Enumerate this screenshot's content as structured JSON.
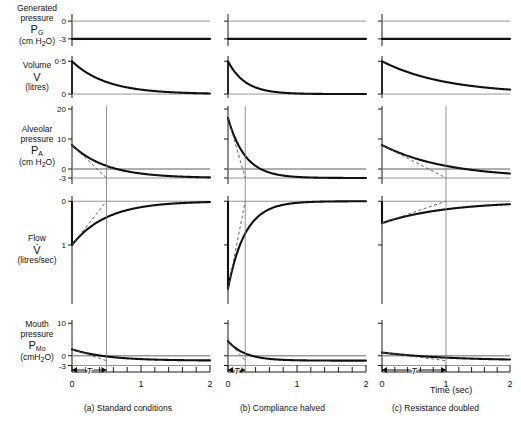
{
  "figure": {
    "xaxis_title": "Time (sec)",
    "x_ticklabels": [
      "0",
      "1",
      "2"
    ],
    "x_tickvalues": [
      0,
      1,
      2
    ],
    "x_minor_step": 0.2,
    "xlim": [
      0,
      2
    ],
    "tau_label": "T"
  },
  "rows": [
    {
      "id": "generated-pressure",
      "label_line1": "Generated",
      "label_line2": "pressure",
      "symbol": "P",
      "symbol_sub": "G",
      "units": "(cm H",
      "units_sub": "2",
      "units_tail": "O)",
      "yticklabels": [
        "0",
        "-3"
      ],
      "ytickvalues": [
        0,
        -3
      ],
      "ylim": [
        -4.2,
        1.2
      ]
    },
    {
      "id": "volume",
      "label_line1": "Volume",
      "label_line2": "",
      "symbol": "V",
      "symbol_sub": "",
      "units": "(litres)",
      "units_sub": "",
      "units_tail": "",
      "yticklabels": [
        "0·5",
        "0"
      ],
      "ytickvalues": [
        0.5,
        0
      ],
      "ylim": [
        -0.06,
        0.58
      ]
    },
    {
      "id": "alveolar-pressure",
      "label_line1": "Alveolar",
      "label_line2": "pressure",
      "symbol": "P",
      "symbol_sub": "A",
      "units": "(cm H",
      "units_sub": "2",
      "units_tail": "O)",
      "yticklabels": [
        "20",
        "10",
        "0",
        "-3"
      ],
      "ytickvalues": [
        20,
        10,
        0,
        -3
      ],
      "ylim": [
        -5.0,
        21.0
      ]
    },
    {
      "id": "flow",
      "label_line1": "Flow",
      "label_line2": "",
      "symbol": "V̇",
      "symbol_sub": "",
      "units": "(litres/sec)",
      "units_sub": "",
      "units_tail": "",
      "yticklabels": [
        "0",
        "1"
      ],
      "ytickvalues": [
        0,
        -1
      ],
      "ylim": [
        -2.35,
        0.12
      ]
    },
    {
      "id": "mouth-pressure",
      "label_line1": "Mouth",
      "label_line2": "pressure",
      "symbol": "P",
      "symbol_sub": "Mo",
      "units": "(cmH",
      "units_sub": "2",
      "units_tail": "O)",
      "yticklabels": [
        "10",
        "0",
        "-3"
      ],
      "ytickvalues": [
        10,
        0,
        -3
      ],
      "ylim": [
        -5.0,
        11.0
      ]
    }
  ],
  "columns": [
    {
      "id": "standard",
      "caption_letter": "(a)",
      "caption_text": "Standard conditions",
      "tau": 0.5,
      "chart_data": {
        "type": "line",
        "series": [
          {
            "name": "Generated pressure P_G",
            "kind": "constant",
            "value": -3,
            "units": "cmH2O"
          },
          {
            "name": "Volume V",
            "kind": "exp_decay",
            "start": 0.5,
            "asymptote": 0,
            "tau": 0.5,
            "units": "litres"
          },
          {
            "name": "Alveolar pressure P_A",
            "kind": "exp_decay",
            "start": 8,
            "asymptote": -3,
            "tau": 0.5,
            "units": "cmH2O"
          },
          {
            "name": "Flow V_dot",
            "kind": "exp_rise",
            "start": -1.0,
            "asymptote": 0,
            "tau": 0.5,
            "units": "litres/sec"
          },
          {
            "name": "Mouth pressure P_Mo",
            "kind": "exp_decay",
            "start": 2.0,
            "asymptote": -1.5,
            "tau": 0.5,
            "units": "cmH2O"
          }
        ]
      }
    },
    {
      "id": "compliance-halved",
      "caption_letter": "(b)",
      "caption_text": "Compliance halved",
      "tau": 0.25,
      "chart_data": {
        "type": "line",
        "series": [
          {
            "name": "Generated pressure P_G",
            "kind": "constant",
            "value": -3,
            "units": "cmH2O"
          },
          {
            "name": "Volume V",
            "kind": "exp_decay",
            "start": 0.5,
            "asymptote": 0,
            "tau": 0.25,
            "units": "litres"
          },
          {
            "name": "Alveolar pressure P_A",
            "kind": "exp_decay",
            "start": 17,
            "asymptote": -3,
            "tau": 0.25,
            "units": "cmH2O"
          },
          {
            "name": "Flow V_dot",
            "kind": "exp_rise",
            "start": -2.0,
            "asymptote": 0,
            "tau": 0.25,
            "units": "litres/sec"
          },
          {
            "name": "Mouth pressure P_Mo",
            "kind": "exp_decay",
            "start": 4.5,
            "asymptote": -1.5,
            "tau": 0.25,
            "units": "cmH2O"
          }
        ]
      }
    },
    {
      "id": "resistance-doubled",
      "caption_letter": "(c)",
      "caption_text": "Resistance doubled",
      "tau": 1.0,
      "chart_data": {
        "type": "line",
        "series": [
          {
            "name": "Generated pressure P_G",
            "kind": "constant",
            "value": -3,
            "units": "cmH2O"
          },
          {
            "name": "Volume V",
            "kind": "exp_decay",
            "start": 0.5,
            "asymptote": 0,
            "tau": 1.0,
            "units": "litres"
          },
          {
            "name": "Alveolar pressure P_A",
            "kind": "exp_decay",
            "start": 8,
            "asymptote": -3,
            "tau": 1.0,
            "units": "cmH2O"
          },
          {
            "name": "Flow V_dot",
            "kind": "exp_rise",
            "start": -0.5,
            "asymptote": 0,
            "tau": 1.0,
            "units": "litres/sec"
          },
          {
            "name": "Mouth pressure P_Mo",
            "kind": "exp_decay",
            "start": 1.0,
            "asymptote": -1.5,
            "tau": 1.0,
            "units": "cmH2O"
          }
        ]
      }
    }
  ]
}
